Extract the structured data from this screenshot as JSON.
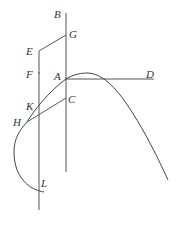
{
  "diagram": {
    "type": "geometric-construction",
    "points": {
      "B": {
        "label": "B",
        "x": 66,
        "y": 13
      },
      "G": {
        "label": "G",
        "x": 66,
        "y": 35
      },
      "E": {
        "label": "E",
        "x": 39,
        "y": 51
      },
      "F": {
        "label": "F",
        "x": 39,
        "y": 73
      },
      "A": {
        "label": "A",
        "x": 66,
        "y": 79
      },
      "D": {
        "label": "D",
        "x": 154,
        "y": 79
      },
      "C": {
        "label": "C",
        "x": 66,
        "y": 98
      },
      "K": {
        "label": "K",
        "x": 39,
        "y": 104
      },
      "H": {
        "label": "H",
        "x": 27,
        "y": 122
      },
      "L": {
        "label": "L",
        "x": 40,
        "y": 191
      }
    },
    "segments": [
      {
        "name": "BA-axis",
        "from": "B",
        "to": "bottom-right-axis"
      },
      {
        "name": "EG",
        "from": "E",
        "to": "G"
      },
      {
        "name": "left-axis",
        "from": "E",
        "to": "bottom-left-axis"
      },
      {
        "name": "AD",
        "from": "A",
        "to": "D"
      },
      {
        "name": "HC",
        "from": "H",
        "to": "C"
      }
    ],
    "curve": {
      "description": "curve passing through L, H, K, A with a peak right of A, descending to the lower right"
    },
    "colors": {
      "line": "#555555",
      "curve": "#444444",
      "label": "#333333",
      "background": "#ffffff"
    }
  }
}
